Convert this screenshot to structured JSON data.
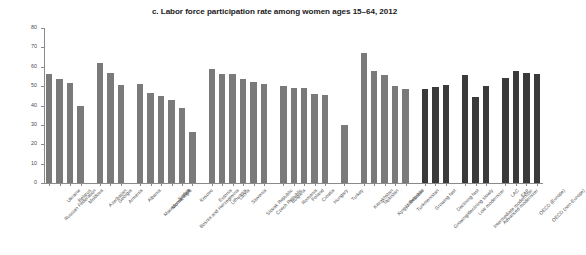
{
  "chart_data": {
    "type": "bar",
    "title": "c. Labor force participation rate among women ages 15–64, 2012",
    "xlabel": "",
    "ylabel": "Percent",
    "ylim": [
      0,
      80
    ],
    "yticks": [
      0,
      10,
      20,
      30,
      40,
      50,
      60,
      70,
      80
    ],
    "grid": false,
    "legend": "none",
    "series_colors": {
      "country": "#7a7a7a",
      "aggregate": "#3a3a3a"
    },
    "categories": [
      "Russian Federation",
      "Ukraine",
      "Belarus",
      "Moldova",
      "Azerbaijan",
      "Georgia",
      "Armenia",
      "Albania",
      "Macedonia, FYR",
      "Montenegro",
      "Serbia",
      "Bosnia and Herzegovina",
      "Kosovo",
      "Estonia",
      "Lithuania",
      "Latvia",
      "Slovenia",
      "Slovak Republic",
      "Czech Republic",
      "Bulgaria",
      "Romania",
      "Poland",
      "Croatia",
      "Hungary",
      "Turkey",
      "Kazakhstan",
      "Tajikistan",
      "Kyrgyz Republic",
      "Uzbekistan",
      "Turkmenistan",
      "Growing fast",
      "Growing/declining slowly",
      "Declining fast",
      "Low modernizer",
      "Intermediate modernizer",
      "Advanced modernizer",
      "LAC",
      "EAP",
      "OECD (Europe)",
      "OECD (non-Europe)"
    ],
    "values": [
      56.5,
      53.5,
      51.5,
      40.0,
      62.0,
      57.0,
      50.5,
      51.0,
      46.5,
      45.0,
      43.0,
      38.5,
      26.5,
      59.0,
      56.5,
      56.5,
      53.5,
      52.0,
      51.0,
      50.0,
      49.0,
      49.0,
      46.0,
      45.5,
      30.0,
      67.0,
      58.0,
      56.0,
      50.0,
      48.5,
      48.5,
      49.5,
      50.5,
      56.0,
      44.5,
      50.0,
      54.0,
      58.0,
      57.0,
      56.5
    ],
    "bar_types": [
      "country",
      "country",
      "country",
      "country",
      "country",
      "country",
      "country",
      "country",
      "country",
      "country",
      "country",
      "country",
      "country",
      "country",
      "country",
      "country",
      "country",
      "country",
      "country",
      "country",
      "country",
      "country",
      "country",
      "country",
      "country",
      "country",
      "country",
      "country",
      "country",
      "country",
      "aggregate",
      "aggregate",
      "aggregate",
      "aggregate",
      "aggregate",
      "aggregate",
      "aggregate",
      "aggregate",
      "aggregate",
      "aggregate"
    ],
    "group_gaps_after": [
      3,
      6,
      12,
      18,
      23,
      24,
      29,
      32,
      35
    ]
  }
}
